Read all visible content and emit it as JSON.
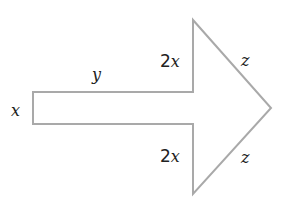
{
  "diagram": {
    "shape": "arrow",
    "stroke_color": "#a9a9a9",
    "fill_color": "#ffffff",
    "labels": {
      "shaft_width": "x",
      "shaft_length": "y",
      "upper_step_coef": "2",
      "upper_step_var": "x",
      "lower_step_coef": "2",
      "lower_step_var": "x",
      "upper_slant": "z",
      "lower_slant": "z"
    }
  }
}
